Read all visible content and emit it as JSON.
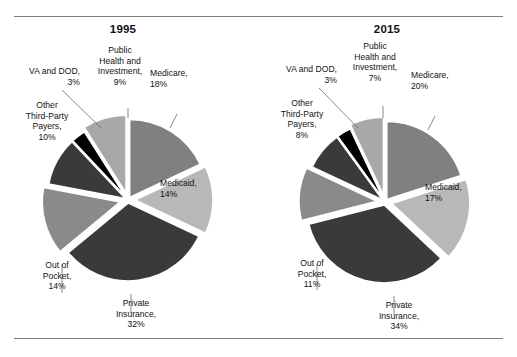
{
  "figure": {
    "rule_color": "#7d7d7d",
    "background": "#ffffff"
  },
  "chart_data": [
    {
      "type": "pie",
      "title": "1995",
      "xlabel": "",
      "ylabel": "",
      "legend_position": "callout-labels",
      "grid": false,
      "categories": [
        "Medicare",
        "Medicaid",
        "Private Insurance",
        "Out of Pocket",
        "Other Third-Party Payers",
        "VA and DOD",
        "Public Health and Investment"
      ],
      "values": [
        18,
        14,
        32,
        14,
        10,
        3,
        9
      ],
      "unit": "%",
      "colors": [
        "#808080",
        "#b8b8b8",
        "#3a3a3a",
        "#8a8a8a",
        "#3a3a3a",
        "#000000",
        "#a8a8a8"
      ],
      "labels": [
        "Medicare,\n18%",
        "Medicaid,\n14%",
        "Private\nInsurance,\n32%",
        "Out of\nPocket,\n14%",
        "Other\nThird-Party\nPayers,\n10%",
        "VA and DOD,\n3%",
        "Public\nHealth and\nInvestment,\n9%"
      ]
    },
    {
      "type": "pie",
      "title": "2015",
      "xlabel": "",
      "ylabel": "",
      "legend_position": "callout-labels",
      "grid": false,
      "categories": [
        "Medicare",
        "Medicaid",
        "Private Insurance",
        "Out of Pocket",
        "Other Third-Party Payers",
        "VA and DOD",
        "Public Health and Investment"
      ],
      "values": [
        20,
        17,
        34,
        11,
        8,
        3,
        7
      ],
      "unit": "%",
      "colors": [
        "#808080",
        "#b8b8b8",
        "#3a3a3a",
        "#8a8a8a",
        "#3a3a3a",
        "#000000",
        "#a8a8a8"
      ],
      "labels": [
        "Medicare,\n20%",
        "Medicaid,\n17%",
        "Private\nInsurance,\n34%",
        "Out of\nPocket,\n11%",
        "Other\nThird-Party\nPayers,\n8%",
        "VA and DOD,\n3%",
        "Public\nHealth and\nInvestment,\n7%"
      ]
    }
  ]
}
